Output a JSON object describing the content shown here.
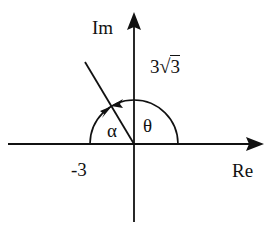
{
  "diagram": {
    "type": "complex-plane-argand",
    "axes": {
      "real_label": "Re",
      "imag_label": "Im"
    },
    "labels": {
      "real_part": "-3",
      "imag_coef": "3",
      "imag_radical": "3",
      "alpha": "α",
      "theta": "θ"
    },
    "colors": {
      "stroke": "#111111",
      "background": "#ffffff"
    }
  }
}
